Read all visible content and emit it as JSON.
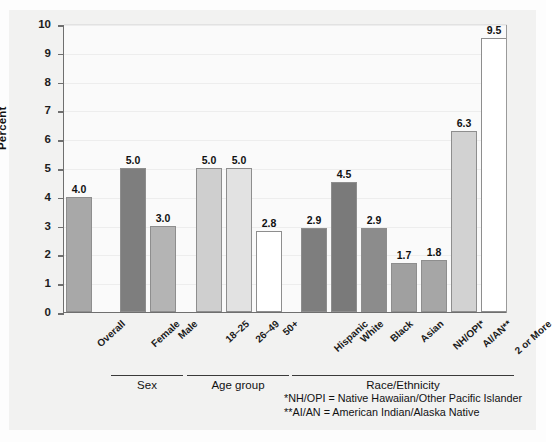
{
  "chart_data": {
    "type": "bar",
    "title": "",
    "xlabel": "",
    "ylabel": "Percent",
    "ylim": [
      0,
      10
    ],
    "ytick_labels": [
      "0",
      "1",
      "2",
      "3",
      "4",
      "5",
      "6",
      "7",
      "8",
      "9",
      "10"
    ],
    "grid": true,
    "legend": "none",
    "categories": [
      "Overall",
      "Female",
      "Male",
      "18–25",
      "26–49",
      "50+",
      "Hispanic",
      "White",
      "Black",
      "Asian",
      "NH/OPI*",
      "AI/AN**",
      "2 or More"
    ],
    "values": [
      4.0,
      5.0,
      3.0,
      5.0,
      5.0,
      2.8,
      2.9,
      4.5,
      2.9,
      1.7,
      1.8,
      6.3,
      9.5
    ],
    "value_labels": [
      "4.0",
      "5.0",
      "3.0",
      "5.0",
      "5.0",
      "2.8",
      "2.9",
      "4.5",
      "2.9",
      "1.7",
      "1.8",
      "6.3",
      "9.5"
    ],
    "bar_colors": [
      "#a8a8a8",
      "#7e7e7e",
      "#b4b4b4",
      "#cfcfcf",
      "#e2e2e2",
      "#ffffff",
      "#7e7e7e",
      "#7a7a7a",
      "#8c8c8c",
      "#a0a0a0",
      "#a6a6a6",
      "#d2d2d2",
      "#ffffff"
    ],
    "groups": [
      {
        "label": "Sex",
        "categories": [
          "Female",
          "Male"
        ]
      },
      {
        "label": "Age group",
        "categories": [
          "18–25",
          "26–49",
          "50+"
        ]
      },
      {
        "label": "Race/Ethnicity",
        "categories": [
          "Hispanic",
          "White",
          "Black",
          "Asian",
          "NH/OPI*",
          "AI/AN**",
          "2 or More"
        ]
      }
    ],
    "annotations": [
      "*NH/OPI = Native Hawaiian/Other Pacific Islander",
      "**AI/AN = American Indian/Alaska Native"
    ]
  },
  "footnotes": {
    "line1": "*NH/OPI = Native Hawaiian/Other Pacific Islander",
    "line2": "**AI/AN = American Indian/Alaska Native"
  },
  "axis": {
    "y_title": "Percent"
  }
}
